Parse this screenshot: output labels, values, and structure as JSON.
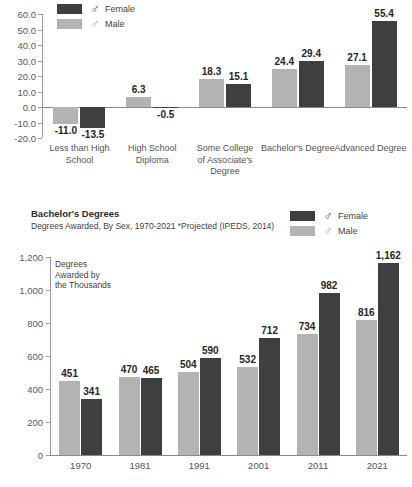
{
  "chart_data": [
    {
      "type": "bar",
      "id": "employment-change-by-education",
      "categories": [
        "Less than High School",
        "High School Diploma",
        "Some College of Associate's Degree",
        "Bachelor's Degree",
        "Advanced Degree"
      ],
      "category_lines": [
        [
          "Less than High",
          "School"
        ],
        [
          "High School",
          "Diploma"
        ],
        [
          "Some College",
          "of Associate's",
          "Degree"
        ],
        [
          "Bachelor's Degree"
        ],
        [
          "Advanced Degree"
        ]
      ],
      "series": [
        {
          "name": "Male",
          "color": "#b3b3b3",
          "symbol": "♂",
          "values": [
            -11.0,
            6.3,
            18.3,
            24.4,
            27.1
          ],
          "labels": [
            "-11.0",
            "6.3",
            "18.3",
            "24.4",
            "27.1"
          ]
        },
        {
          "name": "Female",
          "color": "#3f3f3f",
          "symbol": "♂",
          "values": [
            -13.5,
            -0.5,
            15.1,
            29.4,
            55.4
          ],
          "labels": [
            "-13.5",
            "-0.5",
            "15.1",
            "29.4",
            "55.4"
          ]
        }
      ],
      "ylim": [
        -20.0,
        60.0
      ],
      "yticks": [
        60.0,
        50.0,
        40.0,
        30.0,
        20.0,
        10.0,
        0.0,
        -10.0,
        -20.0
      ],
      "ytick_labels": [
        "60.0",
        "50.0",
        "40.0",
        "30.0",
        "20.0",
        "10.0",
        "0.0",
        "-10.0",
        "-20.0"
      ],
      "title": "",
      "xlabel": "",
      "ylabel": "",
      "grid": false,
      "legend_position": "top-left",
      "legend": [
        {
          "label": "Female",
          "symbol": "♂",
          "color": "#3f3f3f"
        },
        {
          "label": "Male",
          "symbol": "♂",
          "color": "#b3b3b3"
        }
      ]
    },
    {
      "type": "bar",
      "id": "bachelors-degrees-awarded",
      "title": "Bachelor's Degrees",
      "subtitle": "Degrees Awarded, By Sex, 1970-2021 *Projected (IPEDS, 2014)",
      "axis_note": "Degrees Awarded by the Thousands",
      "axis_note_lines": [
        "Degrees",
        "Awarded by",
        "the Thousands"
      ],
      "categories": [
        "1970",
        "1981",
        "1991",
        "2001",
        "2011",
        "2021"
      ],
      "series": [
        {
          "name": "Male",
          "color": "#b3b3b3",
          "symbol": "♂",
          "values": [
            451,
            470,
            504,
            532,
            734,
            816
          ],
          "labels": [
            "451",
            "470",
            "504",
            "532",
            "734",
            "816"
          ]
        },
        {
          "name": "Female",
          "color": "#3f3f3f",
          "symbol": "♂",
          "values": [
            341,
            465,
            590,
            712,
            982,
            1162
          ],
          "labels": [
            "341",
            "465",
            "590",
            "712",
            "982",
            "1,162"
          ]
        }
      ],
      "ylim": [
        0,
        1200
      ],
      "yticks": [
        1200,
        1000,
        800,
        600,
        400,
        200,
        0
      ],
      "ytick_labels": [
        "1,200",
        "1,000",
        "800",
        "600",
        "400",
        "200",
        "0"
      ],
      "xlabel": "",
      "ylabel": "",
      "grid": false,
      "legend_position": "top-right",
      "legend": [
        {
          "label": "Female",
          "symbol": "♂",
          "color": "#3f3f3f"
        },
        {
          "label": "Male",
          "symbol": "♂",
          "color": "#b3b3b3"
        }
      ]
    }
  ],
  "colors": {
    "female": "#3f3f3f",
    "male": "#b3b3b3",
    "axis": "#8a8a8a",
    "text": "#404040",
    "label": "#262626"
  }
}
